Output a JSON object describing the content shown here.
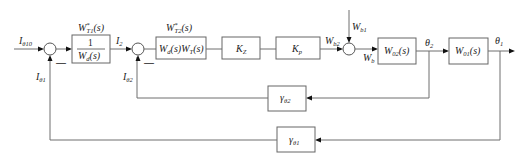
{
  "diagram": {
    "type": "control-loop-block-diagram",
    "signals": {
      "input": {
        "main": "I",
        "sub": "θ10"
      },
      "feedback_outer": {
        "main": "I",
        "sub": "θ1"
      },
      "intermediate_current": {
        "main": "I",
        "sub": "2"
      },
      "feedback_inner": {
        "main": "I",
        "sub": "θ2"
      },
      "wb2": {
        "main": "W",
        "sub": "b2"
      },
      "wb1": {
        "main": "W",
        "sub": "b1"
      },
      "wb": {
        "main": "W",
        "sub": "b"
      },
      "theta2": {
        "main": "θ",
        "sub": "2"
      },
      "theta1": {
        "main": "θ",
        "sub": "1"
      },
      "minus_sign": "—"
    },
    "blocks": {
      "wt1": {
        "title_main": "W",
        "title_sup": "*",
        "title_sub": "T1",
        "title_tail": "(s)",
        "numerator": "1",
        "denominator_main": "W",
        "denominator_sub": "d",
        "denominator_tail": "(s)"
      },
      "wt2": {
        "title_main": "W",
        "title_sup": "*",
        "title_sub": "T2",
        "title_tail": "(s)",
        "body_a_main": "W",
        "body_a_sub": "d",
        "body_a_tail": "(s)",
        "body_b_main": "W",
        "body_b_sub": "T",
        "body_b_tail": "(s)"
      },
      "kz": {
        "main": "K",
        "sub": "Z"
      },
      "kp": {
        "main": "K",
        "sub": "p"
      },
      "w02": {
        "main": "W",
        "sub": "02",
        "tail": "(s)"
      },
      "w01": {
        "main": "W",
        "sub": "01",
        "tail": "(s)"
      },
      "gamma02": {
        "main": "γ",
        "sub": "θ2"
      },
      "gamma01": {
        "main": "γ",
        "sub": "θ1"
      }
    }
  }
}
